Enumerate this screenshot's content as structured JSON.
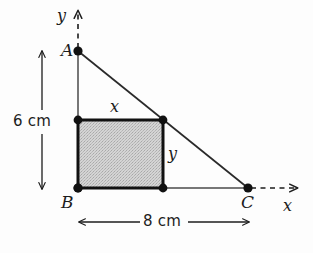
{
  "figure": {
    "background_color": "#fdfdfd",
    "stroke_color": "#1c1c1c",
    "rectangle_fill_color": "#c9c9c9",
    "width": 313,
    "height": 253
  },
  "axes": {
    "y_axis_label": "y",
    "x_axis_label": "x",
    "y_axis_style": "dashed-with-arrow",
    "x_axis_style": "dashed-with-arrow"
  },
  "vertices": [
    {
      "name": "A",
      "label": "A",
      "x": 78,
      "y": 51
    },
    {
      "name": "B",
      "label": "B",
      "x": 78,
      "y": 188
    },
    {
      "name": "C",
      "label": "C",
      "x": 248,
      "y": 188
    }
  ],
  "rectangle": {
    "corners": [
      {
        "name": "top-left",
        "x": 78,
        "y": 120
      },
      {
        "name": "top-right",
        "x": 163,
        "y": 120
      },
      {
        "name": "bottom-right",
        "x": 163,
        "y": 188
      },
      {
        "name": "bottom-left",
        "x": 78,
        "y": 188
      }
    ],
    "width_label": "x",
    "height_label": "y"
  },
  "dimensions": [
    {
      "name": "vertical-height",
      "label": "6 cm",
      "orientation": "vertical",
      "from": {
        "x": 42,
        "y": 50
      },
      "to": {
        "x": 42,
        "y": 190
      }
    },
    {
      "name": "horizontal-base",
      "label": "8 cm",
      "orientation": "horizontal",
      "from": {
        "x": 78,
        "y": 222
      },
      "to": {
        "x": 250,
        "y": 222
      }
    }
  ]
}
